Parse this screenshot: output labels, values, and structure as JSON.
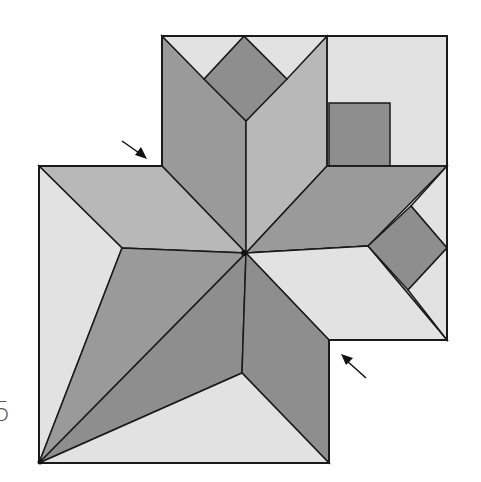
{
  "figure": {
    "label": "5",
    "colors": {
      "light": "#e2e2e2",
      "medium": "#b9b9b9",
      "dark": "#8c8c8c",
      "outline": "#1a1a1a"
    },
    "arrows": [
      {
        "name": "arrow-top-left",
        "from": [
          122,
          141
        ],
        "to": [
          146,
          158
        ]
      },
      {
        "name": "arrow-bottom-right",
        "from": [
          366,
          378
        ],
        "to": [
          343,
          356
        ]
      }
    ]
  }
}
